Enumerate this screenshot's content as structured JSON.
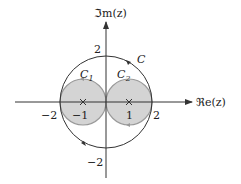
{
  "diagram": {
    "axes": {
      "imag_label": "ℑm(z)",
      "real_label": "ℜe(z)"
    },
    "ticks": {
      "y_pos": "2",
      "y_neg": "−2",
      "x_pos": "2",
      "x_neg": "−2"
    },
    "points": {
      "left": "−1",
      "right": "1"
    },
    "contours": {
      "outer": "C",
      "left": "C",
      "left_sub": "1",
      "right": "C",
      "right_sub": "2"
    },
    "colors": {
      "axis": "#333333",
      "fill": "#d4d4d4",
      "small_circle_stroke": "#999999",
      "outer_stroke": "#333333"
    }
  }
}
